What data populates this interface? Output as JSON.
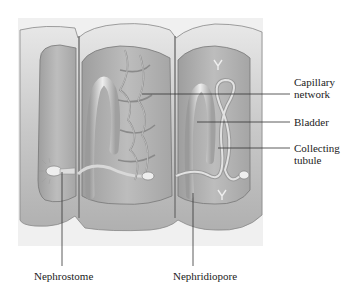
{
  "diagram": {
    "colors": {
      "background": "#ffffff",
      "body_wall": "#c8c8c8",
      "body_wall_highlight": "#e6e6e6",
      "coelom": "#b4b4b4",
      "tubule": "#dcdcdc",
      "leader_line": "#333333",
      "text": "#222222"
    },
    "labels": {
      "capillary_network_line1": "Capillary",
      "capillary_network_line2": "network",
      "bladder": "Bladder",
      "collecting_tubule_line1": "Collecting",
      "collecting_tubule_line2": "tubule",
      "nephrostome": "Nephrostome",
      "nephridiopore": "Nephridiopore"
    }
  }
}
